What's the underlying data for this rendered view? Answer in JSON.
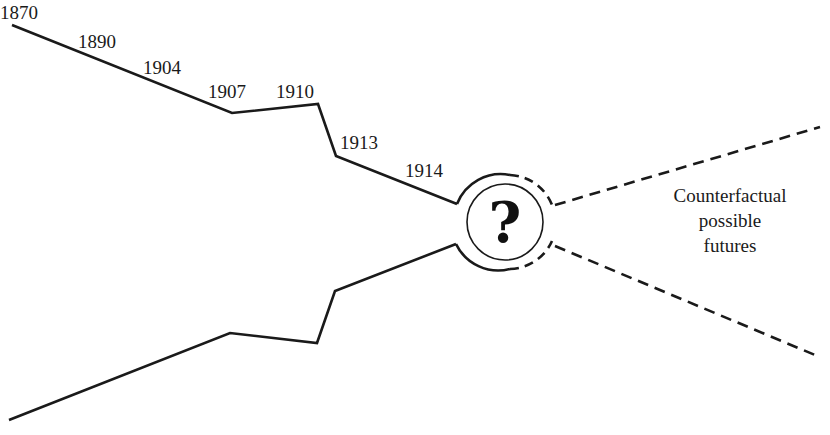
{
  "diagram": {
    "type": "timeline-funnel",
    "years": [
      {
        "label": "1870",
        "x": 0,
        "y": 3
      },
      {
        "label": "1890",
        "x": 78,
        "y": 32
      },
      {
        "label": "1904",
        "x": 143,
        "y": 58
      },
      {
        "label": "1907",
        "x": 208,
        "y": 82
      },
      {
        "label": "1910",
        "x": 276,
        "y": 82
      },
      {
        "label": "1913",
        "x": 340,
        "y": 133
      },
      {
        "label": "1914",
        "x": 405,
        "y": 161
      }
    ],
    "center_symbol": "?",
    "center_icon": "question-mark-icon",
    "caption_lines": [
      "Counterfactual",
      "possible",
      "futures"
    ],
    "line_color": "#1a1a1a"
  }
}
